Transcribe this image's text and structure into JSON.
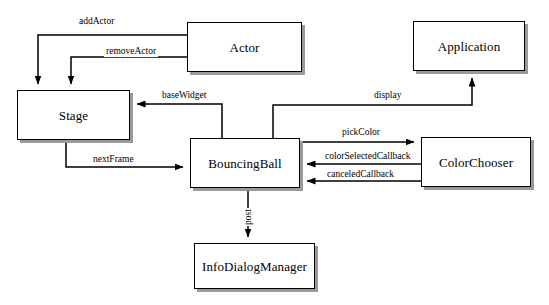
{
  "diagram": {
    "type": "object-collaboration-diagram",
    "background_color": "#ffffff",
    "line_color": "#000000",
    "shadow_color": "#9a9a9a",
    "nodes": [
      {
        "id": "actor",
        "label": "Actor",
        "x": 187,
        "y": 22,
        "w": 115,
        "h": 50
      },
      {
        "id": "application",
        "label": "Application",
        "x": 413,
        "y": 21,
        "w": 112,
        "h": 50
      },
      {
        "id": "stage",
        "label": "Stage",
        "x": 17,
        "y": 90,
        "w": 113,
        "h": 50
      },
      {
        "id": "bouncingball",
        "label": "BouncingBall",
        "x": 190,
        "y": 138,
        "w": 110,
        "h": 50
      },
      {
        "id": "colorchooser",
        "label": "ColorChooser",
        "x": 421,
        "y": 137,
        "w": 110,
        "h": 50
      },
      {
        "id": "infodialogmanager",
        "label": "InfoDialogManager",
        "x": 194,
        "y": 243,
        "w": 121,
        "h": 46
      }
    ],
    "edges": [
      {
        "id": "add-actor",
        "label": "addActor",
        "from": "actor",
        "to": "stage",
        "label_x": 77,
        "label_y": 17,
        "rotated": false
      },
      {
        "id": "remove-actor",
        "label": "removeActor",
        "from": "actor",
        "to": "stage",
        "label_x": 104,
        "label_y": 47,
        "rotated": false
      },
      {
        "id": "base-widget",
        "label": "baseWidget",
        "from": "bouncingball",
        "to": "stage",
        "label_x": 160,
        "label_y": 91,
        "rotated": false
      },
      {
        "id": "display",
        "label": "display",
        "from": "bouncingball",
        "to": "application",
        "label_x": 372,
        "label_y": 91,
        "rotated": false
      },
      {
        "id": "next-frame",
        "label": "nextFrame",
        "from": "stage",
        "to": "bouncingball",
        "label_x": 91,
        "label_y": 155,
        "rotated": false
      },
      {
        "id": "pick-color",
        "label": "pickColor",
        "from": "bouncingball",
        "to": "colorchooser",
        "label_x": 340,
        "label_y": 128,
        "rotated": false
      },
      {
        "id": "color-selected-callback",
        "label": "colorSelectedCallback",
        "from": "colorchooser",
        "to": "bouncingball",
        "label_x": 323,
        "label_y": 152,
        "rotated": false
      },
      {
        "id": "canceled-callback",
        "label": "canceledCallback",
        "from": "colorchooser",
        "to": "bouncingball",
        "label_x": 325,
        "label_y": 170,
        "rotated": false
      },
      {
        "id": "post",
        "label": "post",
        "from": "bouncingball",
        "to": "infodialogmanager",
        "label_x": 244,
        "label_y": 226,
        "rotated": true
      }
    ]
  }
}
